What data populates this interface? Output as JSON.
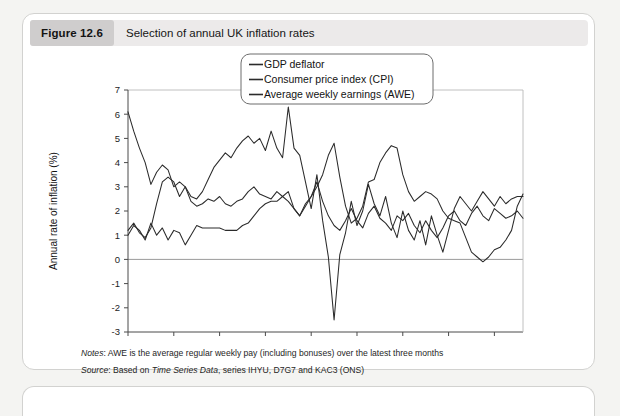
{
  "figure": {
    "badge": "Figure 12.6",
    "caption": "Selection of annual UK inflation rates"
  },
  "notes": {
    "notes_label": "Notes",
    "notes_text": ": AWE is the average regular weekly pay (including bonuses) over the latest three months",
    "source_label": "Source",
    "source_pre": ": Based on ",
    "source_italic": "Time Series Data",
    "source_post": ", series IHYU, D7G7 and KAC3 (ONS)"
  },
  "chart_data": {
    "type": "line",
    "title": "Selection of annual UK inflation rates",
    "xlabel": "",
    "ylabel": "Annual rate of inflation (%)",
    "xlim": [
      2001,
      2018.25
    ],
    "ylim": [
      -3,
      7
    ],
    "yticks": [
      -3,
      -2,
      -1,
      0,
      1,
      2,
      3,
      4,
      5,
      6,
      7
    ],
    "ytick_labels": [
      "-3",
      "-2",
      "-1",
      "0",
      "1",
      "2",
      "3",
      "4",
      "5",
      "6",
      "7"
    ],
    "xticks": [
      2001,
      2003,
      2005,
      2007,
      2009,
      2011,
      2013,
      2015,
      2017
    ],
    "xtick_labels": [
      "2001",
      "2003",
      "2005",
      "2007",
      "2009",
      "2011",
      "2013",
      "2015",
      "2017"
    ],
    "grid": "horizontal-at-0-and-7",
    "legend_position": "top-right-inside",
    "line_color": "#2b2b2b",
    "x_start": 2001.0,
    "x_step": 0.25,
    "series": [
      {
        "name": "GDP deflator",
        "values": [
          1.2,
          1.5,
          1.1,
          0.9,
          1.3,
          2.3,
          3.2,
          3.4,
          3.2,
          2.6,
          3.0,
          2.4,
          2.2,
          2.3,
          2.5,
          2.4,
          2.6,
          2.3,
          2.2,
          2.4,
          2.5,
          2.8,
          3.0,
          2.7,
          2.6,
          2.5,
          2.8,
          2.6,
          2.4,
          2.1,
          1.8,
          2.3,
          2.6,
          3.2,
          2.4,
          1.8,
          1.4,
          1.2,
          1.6,
          2.1,
          1.6,
          1.3,
          1.9,
          2.2,
          1.7,
          1.5,
          1.2,
          1.8,
          1.6,
          1.9,
          1.4,
          1.1,
          1.6,
          1.2,
          0.9,
          1.3,
          1.8,
          2.0,
          1.6,
          1.4,
          1.9,
          2.2,
          1.8,
          1.6,
          2.1,
          1.9,
          1.7,
          1.8,
          2.0,
          1.7
        ]
      },
      {
        "name": "Consumer price index (CPI)",
        "values": [
          1.0,
          1.4,
          1.2,
          0.8,
          1.5,
          1.0,
          1.3,
          0.8,
          1.2,
          1.1,
          0.6,
          1.0,
          1.4,
          1.3,
          1.3,
          1.3,
          1.3,
          1.2,
          1.2,
          1.2,
          1.4,
          1.5,
          1.8,
          2.1,
          2.3,
          2.4,
          2.4,
          2.6,
          2.8,
          2.1,
          1.8,
          2.2,
          2.6,
          3.0,
          3.5,
          4.3,
          4.8,
          3.4,
          2.2,
          1.5,
          1.7,
          2.2,
          3.2,
          3.3,
          4.0,
          4.4,
          4.7,
          4.6,
          3.5,
          2.8,
          2.4,
          2.6,
          2.8,
          2.7,
          2.5,
          2.0,
          1.7,
          1.6,
          1.5,
          0.9,
          0.3,
          0.1,
          -0.1,
          0.1,
          0.4,
          0.5,
          0.8,
          1.2,
          2.2,
          2.7
        ]
      },
      {
        "name": "Average weekly earnings (AWE)",
        "values": [
          6.1,
          5.3,
          4.6,
          4.0,
          3.1,
          3.6,
          3.9,
          3.7,
          3.0,
          3.2,
          3.0,
          2.6,
          2.5,
          2.8,
          3.3,
          3.8,
          4.1,
          4.4,
          4.2,
          4.6,
          4.9,
          5.1,
          4.8,
          5.0,
          4.5,
          5.3,
          4.6,
          4.2,
          6.3,
          4.6,
          4.3,
          3.2,
          2.1,
          3.5,
          1.6,
          0.1,
          -2.5,
          0.2,
          1.1,
          2.4,
          1.4,
          2.0,
          3.1,
          2.3,
          1.8,
          2.6,
          1.5,
          0.9,
          2.0,
          1.2,
          0.8,
          1.6,
          0.6,
          1.8,
          1.0,
          0.3,
          1.2,
          2.1,
          2.6,
          2.3,
          2.0,
          2.4,
          2.8,
          2.5,
          2.2,
          2.6,
          2.3,
          2.5,
          2.6,
          2.6
        ]
      }
    ]
  }
}
